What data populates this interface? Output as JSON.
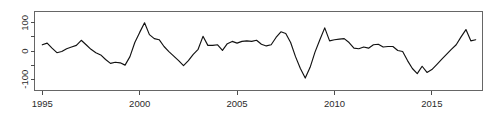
{
  "chart_data": {
    "type": "line",
    "title": "",
    "subtitle": "",
    "xlabel": "",
    "ylabel": "",
    "xlim": [
      1994.6,
      2017.6
    ],
    "ylim": [
      -140,
      140
    ],
    "grid": false,
    "legend": null,
    "annotations": [],
    "x_ticks": [
      1995,
      2000,
      2005,
      2010,
      2015
    ],
    "x_tick_labels": [
      "1995",
      "2000",
      "2005",
      "2010",
      "2015"
    ],
    "x_minor_ticks": [],
    "y_ticks": [
      -100,
      -50,
      0,
      50,
      100
    ],
    "y_tick_labels": [
      "-100",
      "",
      "0",
      "",
      "100"
    ],
    "y_labeled_ticks": [
      -100,
      0,
      100
    ],
    "series": [
      {
        "name": "series-1",
        "color": "#111111",
        "x": [
          1995.0,
          1995.25,
          1995.5,
          1995.75,
          1996.0,
          1996.25,
          1996.5,
          1996.75,
          1997.0,
          1997.25,
          1997.5,
          1997.75,
          1998.0,
          1998.25,
          1998.5,
          1998.75,
          1999.0,
          1999.25,
          1999.5,
          1999.75,
          2000.0,
          2000.25,
          2000.5,
          2000.75,
          2001.0,
          2001.25,
          2001.5,
          2001.75,
          2002.0,
          2002.25,
          2002.5,
          2002.75,
          2003.0,
          2003.25,
          2003.5,
          2003.75,
          2004.0,
          2004.25,
          2004.5,
          2004.75,
          2005.0,
          2005.25,
          2005.5,
          2005.75,
          2006.0,
          2006.25,
          2006.5,
          2006.75,
          2007.0,
          2007.25,
          2007.5,
          2007.75,
          2008.0,
          2008.25,
          2008.5,
          2008.75,
          2009.0,
          2009.25,
          2009.5,
          2009.75,
          2010.0,
          2010.25,
          2010.5,
          2010.75,
          2011.0,
          2011.25,
          2011.5,
          2011.75,
          2012.0,
          2012.25,
          2012.5,
          2012.75,
          2013.0,
          2013.25,
          2013.5,
          2013.75,
          2014.0,
          2014.25,
          2014.5,
          2014.75,
          2015.0,
          2015.25,
          2015.5,
          2015.75,
          2016.0,
          2016.25,
          2016.5,
          2016.75,
          2017.0,
          2017.25
        ],
        "values": [
          22,
          28,
          10,
          -6,
          -2,
          8,
          14,
          20,
          38,
          22,
          6,
          -6,
          -14,
          -30,
          -44,
          -40,
          -42,
          -50,
          -20,
          30,
          66,
          100,
          58,
          44,
          40,
          16,
          -2,
          -18,
          -34,
          -52,
          -34,
          -12,
          6,
          52,
          20,
          20,
          22,
          2,
          26,
          34,
          28,
          34,
          36,
          34,
          38,
          24,
          18,
          22,
          48,
          68,
          62,
          30,
          -20,
          -62,
          -96,
          -58,
          -4,
          40,
          82,
          36,
          40,
          42,
          44,
          30,
          10,
          8,
          14,
          10,
          22,
          24,
          14,
          16,
          16,
          2,
          -2,
          -34,
          -62,
          -80,
          -54,
          -76,
          -66,
          -48,
          -30,
          -12,
          6,
          22,
          50,
          76,
          36,
          40
        ]
      }
    ]
  },
  "axes": {
    "x_tick_labels": [
      "1995",
      "2000",
      "2005",
      "2010",
      "2015"
    ],
    "y_tick_labels": [
      "100",
      "0",
      "-100"
    ]
  }
}
